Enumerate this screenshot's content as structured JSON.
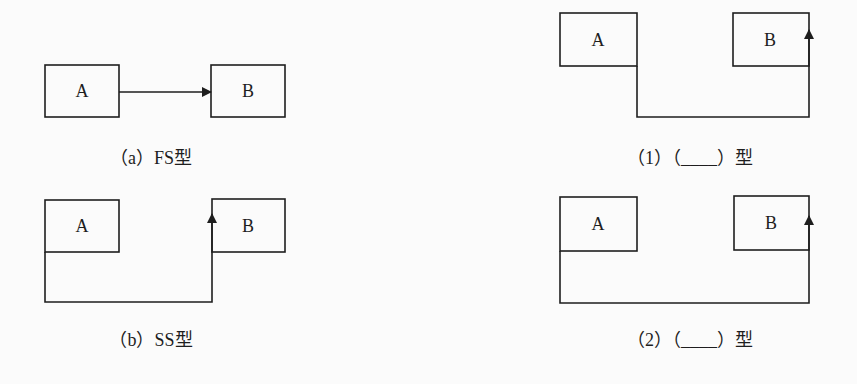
{
  "colors": {
    "stroke": "#1e1e1e",
    "background": "#fbfbfb"
  },
  "panels": [
    {
      "id": "a",
      "box_a": {
        "label": "A"
      },
      "box_b": {
        "label": "B"
      },
      "caption": "（a）FS型",
      "relation": "finish-to-start"
    },
    {
      "id": "b",
      "box_a": {
        "label": "A"
      },
      "box_b": {
        "label": "B"
      },
      "caption": "（b）SS型",
      "relation": "start-to-start"
    },
    {
      "id": "1",
      "box_a": {
        "label": "A"
      },
      "box_b": {
        "label": "B"
      },
      "caption": "（1）（____）型",
      "relation": "finish-to-finish"
    },
    {
      "id": "2",
      "box_a": {
        "label": "A"
      },
      "box_b": {
        "label": "B"
      },
      "caption": "（2）（____）型",
      "relation": "start-to-finish"
    }
  ]
}
